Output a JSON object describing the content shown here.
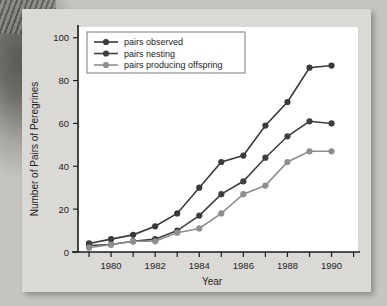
{
  "chart_data": {
    "type": "line",
    "title": "",
    "xlabel": "Year",
    "ylabel": "Number of Pairs of Peregrines",
    "x": [
      1979,
      1980,
      1981,
      1982,
      1983,
      1984,
      1985,
      1986,
      1987,
      1988,
      1989,
      1990
    ],
    "xlim": [
      1978.5,
      1991.2
    ],
    "ylim": [
      0,
      105
    ],
    "xticks": [
      1979,
      1980,
      1981,
      1982,
      1983,
      1984,
      1985,
      1986,
      1987,
      1988,
      1989,
      1990,
      1991
    ],
    "xtick_labels": [
      "",
      "1980",
      "",
      "1982",
      "",
      "1984",
      "",
      "1986",
      "",
      "1988",
      "",
      "1990",
      ""
    ],
    "yticks": [
      0,
      20,
      40,
      60,
      80,
      100
    ],
    "ytick_labels": [
      "0",
      "20",
      "40",
      "60",
      "80",
      "100"
    ],
    "grid": false,
    "legend_position": "top-left",
    "series": [
      {
        "name": "pairs observed",
        "color": "#3a3a3a",
        "values": [
          4,
          6,
          8,
          12,
          18,
          30,
          42,
          45,
          59,
          70,
          86,
          87
        ]
      },
      {
        "name": "pairs nesting",
        "color": "#3f3f3f",
        "values": [
          3,
          3.5,
          5,
          6,
          10,
          17,
          27,
          33,
          44,
          54,
          61,
          60
        ]
      },
      {
        "name": "pairs producing offspring",
        "color": "#8e8e8e",
        "values": [
          2,
          3.5,
          5,
          5,
          9,
          11,
          18,
          27,
          31,
          42,
          47,
          47
        ]
      }
    ]
  },
  "axes": {
    "xlabel": "Year",
    "ylabel": "Number of Pairs of Peregrines"
  },
  "colors": {
    "panel_background": "#dbd9d5",
    "plot_background": "#ffffff",
    "axis": "#1b1b1b",
    "series_observed": "#3a3a3a",
    "series_nesting": "#3f3f3f",
    "series_offspring": "#8e8e8e"
  }
}
